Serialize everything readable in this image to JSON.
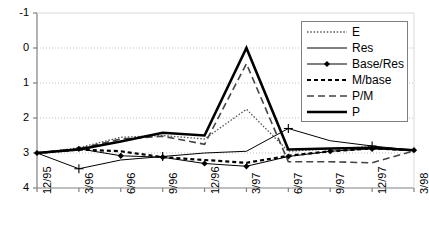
{
  "chart_data": {
    "type": "line",
    "title": "",
    "xlabel": "",
    "ylabel": "",
    "categories": [
      "12/95",
      "3/96",
      "6/96",
      "9/96",
      "12/96",
      "3/97",
      "6/97",
      "9/97",
      "12/97",
      "3/98"
    ],
    "ylim": [
      -1,
      4
    ],
    "yticks": [
      -1,
      0,
      1,
      2,
      3,
      4
    ],
    "grid": true,
    "legend_position": "top-right",
    "series": [
      {
        "name": "E",
        "style": "dotted",
        "values": [
          0.0,
          0.15,
          0.45,
          0.5,
          0.4,
          1.25,
          0.05,
          0.12,
          0.18,
          0.08
        ]
      },
      {
        "name": "Res",
        "style": "thin-solid",
        "values": [
          0.0,
          -0.45,
          -0.2,
          -0.1,
          0.0,
          0.05,
          0.7,
          0.35,
          0.2,
          0.08
        ]
      },
      {
        "name": "Base/Res",
        "style": "solid-diamond",
        "values": [
          0.0,
          0.12,
          -0.08,
          -0.12,
          -0.3,
          -0.38,
          -0.1,
          0.05,
          0.12,
          0.08
        ]
      },
      {
        "name": "M/base",
        "style": "dashed-bold",
        "values": [
          0.0,
          0.1,
          0.05,
          -0.12,
          -0.2,
          -0.28,
          -0.08,
          0.05,
          0.13,
          0.08
        ]
      },
      {
        "name": "P/M",
        "style": "long-dash",
        "values": [
          0.0,
          0.12,
          0.4,
          0.48,
          0.25,
          2.55,
          -0.25,
          -0.25,
          -0.28,
          0.06
        ]
      },
      {
        "name": "P",
        "style": "thick-solid",
        "values": [
          0.0,
          0.1,
          0.33,
          0.58,
          0.5,
          3.0,
          0.1,
          0.13,
          0.15,
          0.08
        ]
      }
    ]
  },
  "axis": {
    "y_labels": [
      "4",
      "3",
      "2",
      "1",
      "0",
      "-1"
    ],
    "x_labels": [
      "12/95",
      "3/96",
      "6/96",
      "9/96",
      "12/96",
      "3/97",
      "6/97",
      "9/97",
      "12/97",
      "3/98"
    ]
  },
  "legend": {
    "items": [
      {
        "label": "E"
      },
      {
        "label": "Res"
      },
      {
        "label": "Base/Res"
      },
      {
        "label": "M/base"
      },
      {
        "label": "P/M"
      },
      {
        "label": "P"
      }
    ]
  },
  "colors": {
    "line": "#000000",
    "grid": "#bfbfbf",
    "axis": "#808080",
    "background": "#ffffff",
    "legend_border": "#7f7f7f"
  }
}
